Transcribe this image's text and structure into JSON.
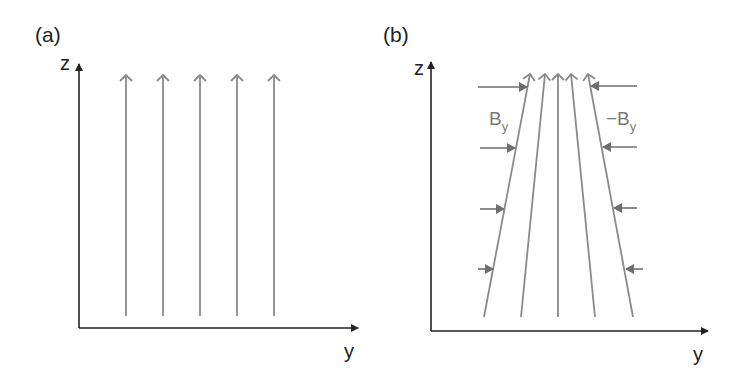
{
  "figure": {
    "panels": [
      {
        "id": "a",
        "label": "(a)",
        "axes": {
          "vertical": "z",
          "horizontal": "y"
        },
        "description": "Uniform vertical magnetic field lines",
        "field_lines": 5
      },
      {
        "id": "b",
        "label": "(b)",
        "axes": {
          "vertical": "z",
          "horizontal": "y"
        },
        "description": "Converging field lines compressed by opposing horizontal field components",
        "field_lines": 5,
        "left_label": {
          "main": "B",
          "sub": "y"
        },
        "right_label": {
          "main": "−B",
          "sub": "y"
        },
        "side_arrows_per_side": 4
      }
    ],
    "colors": {
      "axis": "#222222",
      "field_line": "#8a8a8a",
      "side_arrow": "#6e6e6e",
      "label": "#7a7a7a"
    }
  }
}
